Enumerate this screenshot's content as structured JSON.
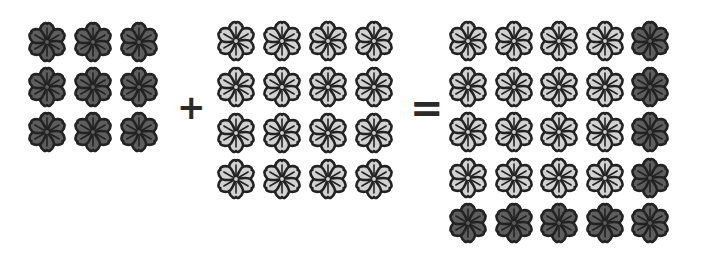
{
  "colors": {
    "dark_fill": "#5e5e5e",
    "light_fill": "#d2d2d2",
    "outline": "#222222"
  },
  "groups": [
    {
      "id": "left",
      "rows": 3,
      "cols": 3,
      "left": 25,
      "top": 20,
      "pitch_x": 46,
      "pitch_y": 45,
      "cells": [
        "d",
        "d",
        "d",
        "d",
        "d",
        "d",
        "d",
        "d",
        "d"
      ]
    },
    {
      "id": "middle",
      "rows": 4,
      "cols": 4,
      "left": 214,
      "top": 19,
      "pitch_x": 46,
      "pitch_y": 46,
      "cells": [
        "l",
        "l",
        "l",
        "l",
        "l",
        "l",
        "l",
        "l",
        "l",
        "l",
        "l",
        "l",
        "l",
        "l",
        "l",
        "l"
      ]
    },
    {
      "id": "right",
      "rows": 5,
      "cols": 5,
      "left": 446,
      "top": 19,
      "pitch_x": 45.5,
      "pitch_y": 45.5,
      "cells": [
        "l",
        "l",
        "l",
        "l",
        "d",
        "l",
        "l",
        "l",
        "l",
        "d",
        "l",
        "l",
        "l",
        "l",
        "d",
        "l",
        "l",
        "l",
        "l",
        "d",
        "d",
        "d",
        "d",
        "d",
        "d"
      ]
    }
  ],
  "operators": {
    "plus": "+",
    "equals": "="
  },
  "equation_text": "3×3 + 4×4 = 5×5"
}
